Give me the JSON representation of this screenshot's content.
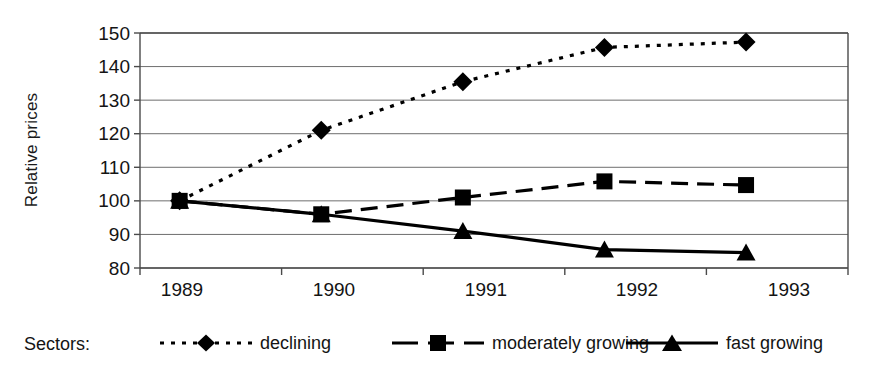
{
  "chart_data": {
    "type": "line",
    "title": "",
    "subtitle": "",
    "xlabel": "",
    "ylabel": "Relative prices",
    "categories": [
      "1989",
      "1990",
      "1991",
      "1992",
      "1993"
    ],
    "ylim": [
      80,
      150
    ],
    "yticks": [
      150,
      140,
      130,
      120,
      110,
      100,
      90,
      80
    ],
    "grid": true,
    "legend_position": "bottom",
    "legend_caption": "Sectors:",
    "series": [
      {
        "name": "declining",
        "marker": "diamond",
        "line_style": "dotted",
        "color": "#000000",
        "values": [
          100,
          121,
          135.5,
          145.7,
          147.3
        ]
      },
      {
        "name": "moderately growing",
        "marker": "square",
        "line_style": "dashed",
        "color": "#000000",
        "values": [
          100,
          96,
          101,
          105.8,
          104.7
        ]
      },
      {
        "name": "fast growing",
        "marker": "triangle",
        "line_style": "solid",
        "color": "#000000",
        "values": [
          100,
          96,
          91,
          85.5,
          84.6
        ]
      }
    ]
  },
  "axis": {
    "y_title": "Relative prices",
    "y_tick_labels": [
      "150",
      "140",
      "130",
      "120",
      "110",
      "100",
      "90",
      "80"
    ],
    "x_tick_labels": [
      "1989",
      "1990",
      "1991",
      "1992",
      "1993"
    ]
  },
  "legend": {
    "caption": "Sectors:",
    "items": [
      {
        "label": "declining",
        "marker": "diamond-marker-icon",
        "line": "dotted"
      },
      {
        "label": "moderately growing",
        "marker": "square-marker-icon",
        "line": "dashed"
      },
      {
        "label": "fast growing",
        "marker": "triangle-marker-icon",
        "line": "solid"
      }
    ]
  },
  "colors": {
    "ink": "#000000",
    "grid": "#6e6e6e",
    "axis": "#4a4a4a",
    "background": "#ffffff"
  }
}
